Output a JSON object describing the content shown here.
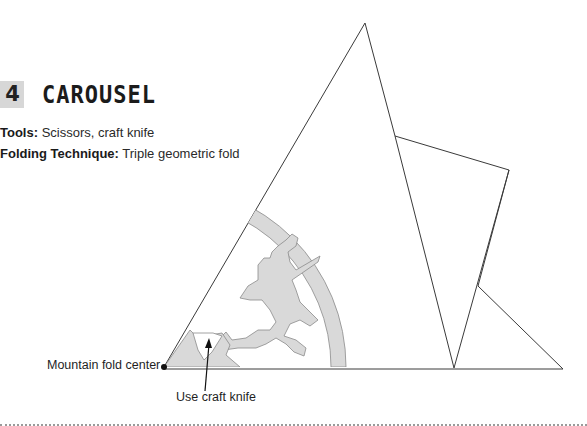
{
  "header": {
    "number": "4",
    "title": "CAROUSEL"
  },
  "meta": {
    "tools_label": "Tools:",
    "tools_value": " Scissors, craft knife",
    "technique_label": "Folding Technique:",
    "technique_value": " Triple geometric fold"
  },
  "annotations": {
    "center_label": "Mountain fold center",
    "knife_label": "Use craft knife"
  },
  "colors": {
    "badge": "#d7d7d7",
    "cut_fill": "#d9d9d9",
    "line": "#333333"
  }
}
